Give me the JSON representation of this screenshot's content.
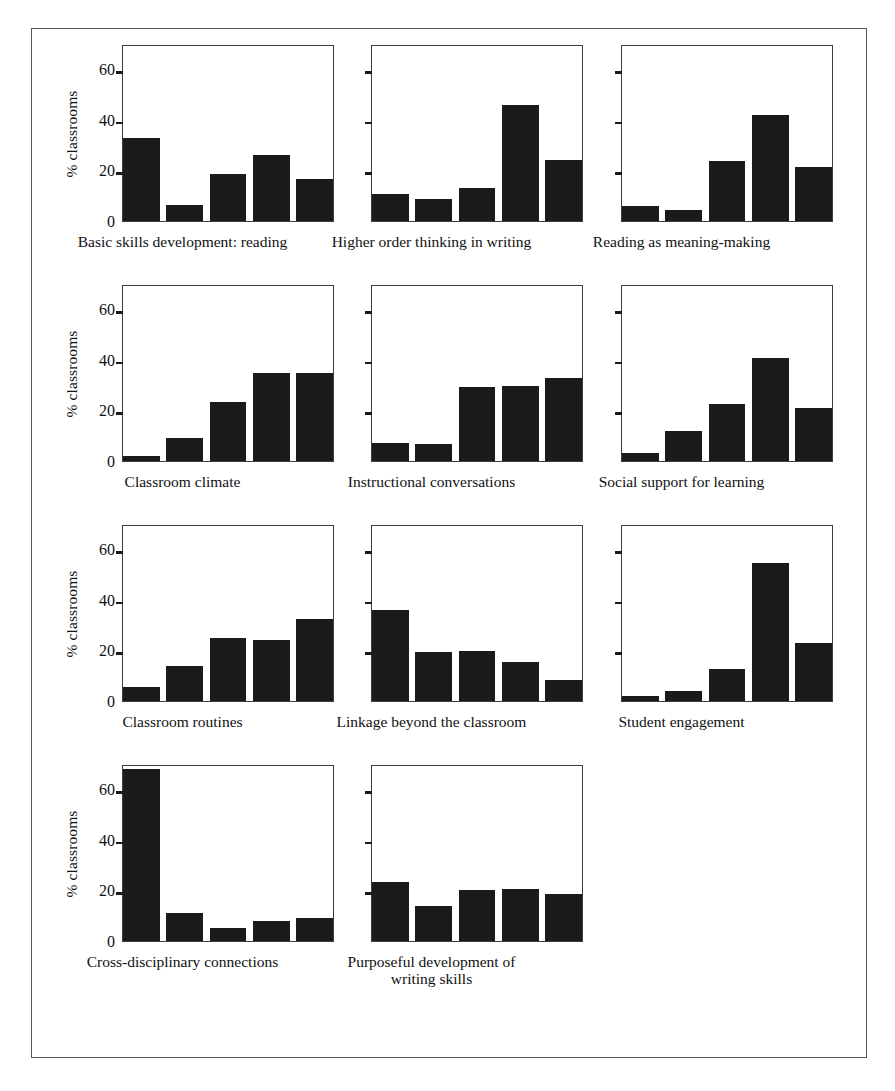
{
  "figure": {
    "ylabel": "% classrooms",
    "ytick_labels": [
      "0",
      "20",
      "40",
      "60"
    ],
    "frame_color": "#55575a",
    "bar_color": "#1b1b1b",
    "axis_color": "#3c3e40"
  },
  "chart_data": {
    "type": "bar",
    "title": "",
    "xlabel": "",
    "ylabel": "% classrooms",
    "ylim": [
      0,
      70
    ],
    "yticks": [
      0,
      20,
      40,
      60
    ],
    "grid": false,
    "legend": "none",
    "categories": [
      "1",
      "2",
      "3",
      "4",
      "5"
    ],
    "panels": [
      {
        "title": "Basic skills development: reading",
        "values": [
          33,
          6.3,
          18.7,
          26,
          16.8
        ]
      },
      {
        "title": "Higher order thinking in writing",
        "values": [
          10.5,
          8.8,
          13,
          46,
          24
        ]
      },
      {
        "title": "Reading as meaning-making",
        "values": [
          6,
          4.5,
          23.8,
          42,
          21.4
        ]
      },
      {
        "title": "Classroom climate",
        "values": [
          2,
          9,
          23.5,
          34.8,
          34.8
        ]
      },
      {
        "title": "Instructional conversations",
        "values": [
          7,
          6.7,
          29.4,
          29.6,
          33
        ]
      },
      {
        "title": "Social support for learning",
        "values": [
          3,
          12,
          22.5,
          40.8,
          21
        ]
      },
      {
        "title": "Classroom routines",
        "values": [
          5.5,
          14,
          25,
          24.2,
          32.4
        ]
      },
      {
        "title": "Linkage beyond the classroom",
        "values": [
          36,
          19.5,
          19.8,
          15.5,
          8.5
        ]
      },
      {
        "title": "Student engagement",
        "values": [
          2,
          4,
          12.5,
          54.5,
          23
        ]
      },
      {
        "title": "Cross-disciplinary connections",
        "values": [
          68,
          11,
          5.3,
          8,
          9
        ]
      },
      {
        "title": "Purposeful development of\nwriting skills",
        "values": [
          23.5,
          13.8,
          20,
          20.5,
          18.8
        ]
      }
    ]
  }
}
